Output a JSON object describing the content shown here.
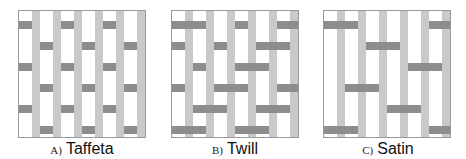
{
  "figure": {
    "colors": {
      "warp": "#c9c9c9",
      "weft": "#8d8d8d",
      "background": "#ffffff",
      "border": "#9a9a9a"
    },
    "grid": {
      "warps": 6,
      "wefts": 6
    },
    "panels": [
      {
        "id": "taffeta",
        "letter": "A)",
        "name": "Taffeta",
        "weft_over": [
          [
            1,
            0,
            1,
            0,
            1,
            0,
            1
          ],
          [
            0,
            1,
            0,
            1,
            0,
            1,
            0
          ],
          [
            1,
            0,
            1,
            0,
            1,
            0,
            1
          ],
          [
            0,
            1,
            0,
            1,
            0,
            1,
            0
          ],
          [
            1,
            0,
            1,
            0,
            1,
            0,
            1
          ],
          [
            0,
            1,
            0,
            1,
            0,
            1,
            0
          ]
        ]
      },
      {
        "id": "twill",
        "letter": "B)",
        "name": "Twill",
        "weft_over": [
          [
            1,
            1,
            0,
            1,
            0,
            1,
            1
          ],
          [
            1,
            0,
            1,
            0,
            1,
            1,
            0
          ],
          [
            0,
            1,
            0,
            1,
            1,
            0,
            1
          ],
          [
            1,
            0,
            1,
            1,
            0,
            1,
            1
          ],
          [
            0,
            1,
            1,
            0,
            1,
            1,
            0
          ],
          [
            1,
            1,
            0,
            1,
            1,
            0,
            1
          ]
        ]
      },
      {
        "id": "satin",
        "letter": "C)",
        "name": "Satin",
        "weft_over": [
          [
            1,
            1,
            0,
            0,
            0,
            1,
            1
          ],
          [
            0,
            0,
            1,
            1,
            0,
            0,
            0
          ],
          [
            0,
            0,
            0,
            0,
            1,
            1,
            0
          ],
          [
            0,
            1,
            1,
            0,
            0,
            0,
            0
          ],
          [
            0,
            0,
            0,
            1,
            1,
            0,
            0
          ],
          [
            1,
            1,
            0,
            0,
            0,
            1,
            1
          ]
        ]
      }
    ]
  }
}
